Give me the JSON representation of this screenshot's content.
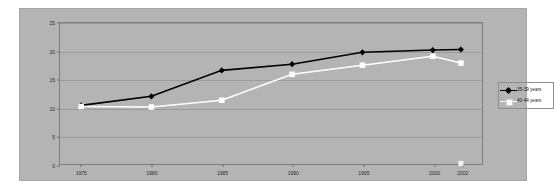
{
  "chart_data": {
    "type": "line",
    "title": "",
    "subtitle": "",
    "xlabel": "",
    "ylabel": "",
    "categories": [
      "1975",
      "1980",
      "1985",
      "1990",
      "1995",
      "2000",
      "2002"
    ],
    "x": [
      1975,
      1980,
      1985,
      1990,
      1995,
      2000,
      2002
    ],
    "xlim": [
      1973.5,
      2003.5
    ],
    "ylim": [
      0,
      25
    ],
    "yticks": [
      0,
      5,
      10,
      15,
      20,
      25
    ],
    "ytick_labels": [
      "0",
      "5",
      "10",
      "15",
      "20",
      "25"
    ],
    "xtick_labels": [
      "1975",
      "1980",
      "1985",
      "1990",
      "1995",
      "2000",
      "2002"
    ],
    "grid": true,
    "grid_axis": "y",
    "legend_position": "right",
    "series": [
      {
        "name": "35-39 years",
        "color": "#000000",
        "marker": "diamond",
        "marker_fill": "#000000",
        "values": [
          10.4,
          12.0,
          16.6,
          17.7,
          19.8,
          20.2,
          20.3
        ]
      },
      {
        "name": "40-44 years",
        "color": "#ffffff",
        "marker": "square",
        "marker_fill": "#ffffff",
        "values": [
          10.2,
          10.1,
          11.3,
          15.9,
          17.5,
          19.1,
          17.9
        ]
      }
    ],
    "annotations": [
      {
        "name": "stray-marker-2002-zero",
        "x": 2002,
        "y": 0.1,
        "marker": "square",
        "color": "#ffffff"
      }
    ],
    "colors": {
      "panel_background": "#b4b4b4",
      "page_background": "#ffffff",
      "gridline": "#9a9a9f",
      "axis_frame": "#7d7d85",
      "series_1": "#000000",
      "series_2": "#ffffff",
      "tick_text": "#2b2b2b"
    }
  },
  "legend": {
    "items": [
      {
        "label": "35-39 years"
      },
      {
        "label": "40-44 years"
      }
    ]
  }
}
